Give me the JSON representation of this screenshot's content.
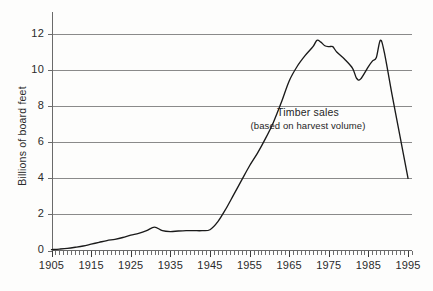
{
  "chart_data": {
    "type": "line",
    "title": "",
    "xlabel": "",
    "ylabel": "Billions of board feet",
    "xlim": [
      1905,
      1996
    ],
    "ylim": [
      0,
      13
    ],
    "grid": true,
    "legend": "none",
    "annotations": [
      {
        "name": "series-annotation",
        "line1": "Timber sales",
        "line2": "(based on harvest volume)"
      }
    ],
    "xticks": [
      1905,
      1915,
      1925,
      1935,
      1945,
      1955,
      1965,
      1975,
      1985,
      1995
    ],
    "xtick_labels": [
      "1905",
      "1915",
      "1925",
      "1935",
      "1945",
      "1955",
      "1965",
      "1975",
      "1985",
      "1995"
    ],
    "minor_xtick_interval": 1,
    "yticks": [
      0,
      2,
      4,
      6,
      8,
      10,
      12
    ],
    "ytick_labels": [
      "0",
      "2",
      "4",
      "6",
      "8",
      "10",
      "12"
    ],
    "series": [
      {
        "name": "Timber sales",
        "color": "#1a1a1a",
        "x": [
          1905,
          1907,
          1909,
          1911,
          1913,
          1915,
          1917,
          1919,
          1921,
          1923,
          1925,
          1927,
          1929,
          1931,
          1933,
          1935,
          1937,
          1939,
          1941,
          1943,
          1945,
          1947,
          1949,
          1951,
          1953,
          1955,
          1957,
          1959,
          1961,
          1963,
          1965,
          1967,
          1969,
          1971,
          1972,
          1973,
          1974,
          1975,
          1976,
          1977,
          1979,
          1981,
          1982,
          1983,
          1985,
          1986,
          1987,
          1988,
          1989,
          1991,
          1993,
          1995
        ],
        "y": [
          0.05,
          0.08,
          0.12,
          0.18,
          0.25,
          0.35,
          0.45,
          0.55,
          0.62,
          0.72,
          0.85,
          0.95,
          1.1,
          1.3,
          1.1,
          1.05,
          1.08,
          1.1,
          1.1,
          1.1,
          1.15,
          1.6,
          2.3,
          3.1,
          3.9,
          4.7,
          5.4,
          6.2,
          7.1,
          8.2,
          9.4,
          10.2,
          10.8,
          11.3,
          11.65,
          11.55,
          11.35,
          11.3,
          11.3,
          11.0,
          10.6,
          10.1,
          9.55,
          9.5,
          10.2,
          10.5,
          10.7,
          11.65,
          11.0,
          8.6,
          6.3,
          4.0
        ]
      }
    ]
  },
  "axis": {
    "y_title": "Billions of board feet"
  }
}
